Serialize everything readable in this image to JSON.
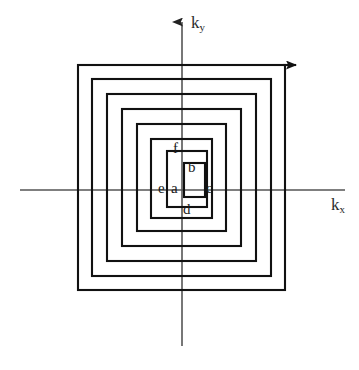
{
  "figure": {
    "type": "diagram",
    "width": 359,
    "height": 370,
    "background_color": "#ffffff"
  },
  "axes": {
    "origin": {
      "x": 182,
      "y": 190
    },
    "color": "#555555",
    "stroke_width": 1.6,
    "x_axis": {
      "label": "k",
      "subscript": "x",
      "label_x": 331,
      "label_y": 196,
      "x_start": 20,
      "x_end": 345,
      "y": 190,
      "arrow": true,
      "arrow_end": "right"
    },
    "y_axis": {
      "label": "k",
      "subscript": "y",
      "label_x": 191,
      "label_y": 14,
      "x": 182,
      "y_start": 346,
      "y_end": 22,
      "arrow": true,
      "arrow_end": "top"
    }
  },
  "zones": {
    "stroke_color": "#111111",
    "stroke_width": 2.1,
    "squares": [
      {
        "name": "zone-ring-6",
        "x": 78,
        "y": 65,
        "width": 207,
        "height": 225
      },
      {
        "name": "zone-ring-5",
        "x": 92,
        "y": 79,
        "width": 179,
        "height": 197
      },
      {
        "name": "zone-ring-4",
        "x": 107,
        "y": 94,
        "width": 149,
        "height": 167
      },
      {
        "name": "zone-ring-3",
        "x": 122,
        "y": 109,
        "width": 119,
        "height": 137
      },
      {
        "name": "zone-ring-2",
        "x": 137,
        "y": 124,
        "width": 89,
        "height": 107
      },
      {
        "name": "zone-ring-1",
        "x": 151,
        "y": 139,
        "width": 61,
        "height": 79
      }
    ],
    "inner_boxes": [
      {
        "name": "inner-box-outer",
        "x": 167,
        "y": 151,
        "width": 40,
        "height": 56
      },
      {
        "name": "inner-box-core",
        "x": 184,
        "y": 163,
        "width": 21,
        "height": 34
      }
    ]
  },
  "labels": [
    {
      "id": "a",
      "text": "a",
      "x": 171,
      "y": 181
    },
    {
      "id": "b",
      "text": "b",
      "x": 188,
      "y": 160
    },
    {
      "id": "c",
      "text": "c",
      "x": 206,
      "y": 181
    },
    {
      "id": "d",
      "text": "d",
      "x": 183,
      "y": 202
    },
    {
      "id": "e",
      "text": "e",
      "x": 158,
      "y": 181
    },
    {
      "id": "f",
      "text": "f",
      "x": 173,
      "y": 141
    }
  ]
}
